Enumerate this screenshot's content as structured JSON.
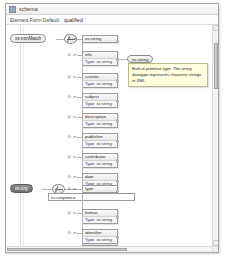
{
  "window": {
    "title": "schema",
    "icon": "schema-icon"
  },
  "propertybar": {
    "label": "Element Form Default:",
    "value": "qualified"
  },
  "diagram": {
    "root_nodes": [
      {
        "id": "root-top",
        "label": "xs:nonMatch",
        "style": "light"
      },
      {
        "id": "root-bottom",
        "label": "xs:org",
        "style": "dark"
      }
    ],
    "type_node": {
      "label": "xs:string"
    },
    "inline_field": {
      "value": "xs:sequence"
    },
    "occurrence_default": "0..∞",
    "type_prefix": "Type:",
    "type_value": "xs:string",
    "elements": [
      {
        "name": "xs:string",
        "type": "",
        "occurrence": "0..∞",
        "single": true
      },
      {
        "name": "title",
        "type": "xs:string",
        "occurrence": "0..∞",
        "single": false
      },
      {
        "name": "creator",
        "type": "xs:string",
        "occurrence": "0..∞",
        "single": false
      },
      {
        "name": "subject",
        "type": "xs:string",
        "occurrence": "0..∞",
        "single": false
      },
      {
        "name": "description",
        "type": "xs:string",
        "occurrence": "0..∞",
        "single": false
      },
      {
        "name": "publisher",
        "type": "xs:string",
        "occurrence": "0..∞",
        "single": false
      },
      {
        "name": "contributor",
        "type": "xs:string",
        "occurrence": "0..∞",
        "single": false
      },
      {
        "name": "date",
        "type": "xs:string",
        "occurrence": "0..∞",
        "single": false
      },
      {
        "name": "type",
        "type": "xs:string",
        "occurrence": "0..∞",
        "single": true
      },
      {
        "name": "format",
        "type": "xs:string",
        "occurrence": "0..∞",
        "single": false
      },
      {
        "name": "identifier",
        "type": "xs:string",
        "occurrence": "0..∞",
        "single": false
      },
      {
        "name": "source",
        "type": "xs:string",
        "occurrence": "0..∞",
        "single": false
      }
    ]
  },
  "tooltip": {
    "text": "Built-in primitive type. The string datatype represents character strings in XML."
  },
  "scrollbars": {
    "vertical_thumb_position": "top",
    "horizontal_thumb_position": "left"
  }
}
